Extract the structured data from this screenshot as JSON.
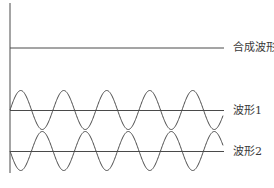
{
  "diagram": {
    "type": "waveform-superposition",
    "colors": {
      "line": "#4a4a4a",
      "background": "#ffffff",
      "text": "#3a3a3a"
    },
    "labels": {
      "composite": "合成波形",
      "wave1": "波形1",
      "wave2": "波形2"
    },
    "waves": [
      {
        "name": "合成波形",
        "kind": "flat",
        "baseline_y": 48,
        "amplitude": 0
      },
      {
        "name": "波形1",
        "kind": "sine",
        "baseline_y": 110,
        "amplitude": 19.5,
        "period_px": 43,
        "phase": "rising"
      },
      {
        "name": "波形2",
        "kind": "sine",
        "baseline_y": 151,
        "amplitude": 19.5,
        "period_px": 43,
        "phase": "falling"
      }
    ],
    "x_start": 10,
    "x_end": 223
  }
}
